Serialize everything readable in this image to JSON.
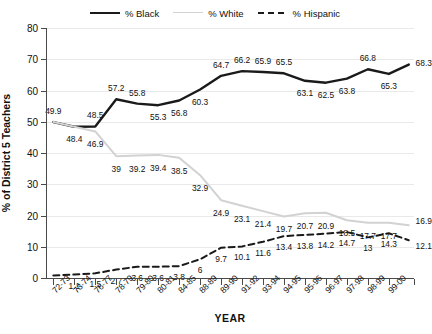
{
  "chart_data": {
    "type": "line",
    "title": "",
    "xlabel": "YEAR",
    "ylabel": "% of District 5 Teachers",
    "ylim": [
      0,
      80
    ],
    "yticks": [
      0,
      10,
      20,
      30,
      40,
      50,
      60,
      70,
      80
    ],
    "grid": true,
    "legend_position": "top-center",
    "categories": [
      "72-73",
      "73-74",
      "76-77",
      "78-79",
      "79-80",
      "80-81",
      "84-85",
      "88-89",
      "89-90",
      "91-92",
      "93-94",
      "94-95",
      "95-96",
      "96-97",
      "97-98",
      "98-99",
      "99-00"
    ],
    "series": [
      {
        "name": "% Black",
        "color": "#1a1a1a",
        "style": "solid",
        "values": [
          49.9,
          48.4,
          48.5,
          57.2,
          55.8,
          55.3,
          56.8,
          60.3,
          64.7,
          66.2,
          65.9,
          65.5,
          63.1,
          62.5,
          63.8,
          66.8,
          65.3
        ],
        "end_value": 68.3,
        "labels": [
          "49.9",
          "48.4",
          "48.5",
          "57.2",
          "55.8",
          "55.3",
          "56.8",
          "60.3",
          "64.7",
          "66.2",
          "65.9",
          "65.5",
          "63.1",
          "62.5",
          "63.8",
          "66.8",
          "65.3"
        ],
        "end_label": "68.3"
      },
      {
        "name": "% White",
        "color": "#d2d2d2",
        "style": "solid",
        "values": [
          49.9,
          48.4,
          46.9,
          39,
          39.2,
          39.4,
          38.5,
          32.9,
          24.9,
          23.1,
          21.4,
          19.7,
          20.7,
          20.9,
          18.5,
          17.7,
          17.7
        ],
        "end_value": 16.9,
        "labels": [
          "",
          "",
          "46.9",
          "39",
          "39.2",
          "39.4",
          "38.5",
          "32.9",
          "24.9",
          "23.1",
          "21.4",
          "19.7",
          "20.7",
          "20.9",
          "18.5",
          "17.7",
          "17.7"
        ],
        "end_label": "16.9"
      },
      {
        "name": "% Hispanic",
        "color": "#1a1a1a",
        "style": "dashed",
        "values": [
          0.8,
          1.1,
          1.5,
          2.7,
          3.6,
          3.6,
          3.8,
          6,
          9.7,
          10.1,
          11.6,
          13.4,
          13.8,
          14.2,
          14.7,
          13,
          14.3
        ],
        "end_value": 12.1,
        "labels": [
          "",
          "1.1",
          "1.5",
          "2.7",
          "3.6",
          "3.6",
          "3.8",
          "6",
          "9.7",
          "10.1",
          "11.6",
          "13.4",
          "13.8",
          "14.2",
          "14.7",
          "13",
          "14.3"
        ],
        "end_label": "12.1"
      }
    ]
  },
  "legend": {
    "items": [
      {
        "label": "% Black"
      },
      {
        "label": "% White"
      },
      {
        "label": "% Hispanic"
      }
    ]
  }
}
